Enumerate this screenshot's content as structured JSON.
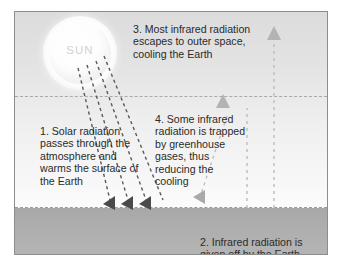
{
  "diagram": {
    "sun": {
      "label": "SUN"
    },
    "captions": {
      "step1": "1. Solar radiation\npasses through the\natmosphere and\nwarms the surface of\nthe Earth",
      "step2": "2. Infrared radiation is\ngiven off by the Earth",
      "step3": "3. Most infrared radiation\nescapes to outer space,\ncooling the Earth",
      "step4": "4. Some infrared\nradiation is trapped\nby greenhouse\ngases, thus\nreducing the\ncooling"
    },
    "colors": {
      "sky_top": "#dcdcdc",
      "sky_bottom": "#ffffff",
      "ground": "#adadad",
      "frame_border": "#8d8d8d",
      "text": "#2b2b2b",
      "solar_ray": "#5a5a5a",
      "infrared_ray": "#b0b0b0",
      "sun_label": "#d2d2d2"
    },
    "layers": {
      "atmosphere_boundary_label": "atmosphere-boundary",
      "ground_boundary_label": "earth-surface"
    }
  }
}
